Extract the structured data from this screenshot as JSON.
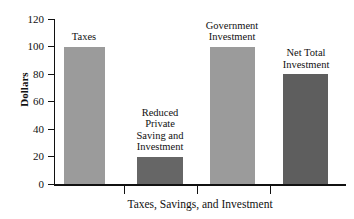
{
  "chart_data": {
    "type": "bar",
    "title": "",
    "xlabel": "Taxes, Savings, and Investment",
    "ylabel": "Dollars",
    "ylim": [
      0,
      120
    ],
    "yticks": [
      0,
      20,
      40,
      60,
      80,
      100,
      120
    ],
    "ytick_labels": [
      "0",
      "20",
      "40",
      "60",
      "80",
      "100",
      "120"
    ],
    "grid": false,
    "legend": null,
    "categories": [
      "Taxes",
      "Reduced\nPrivate\nSaving and\nInvestment",
      "Government\nInvestment",
      "Net Total\nInvestment"
    ],
    "values": [
      100,
      20,
      100,
      80
    ],
    "bar_colors": [
      "#9b9b9b",
      "#666666",
      "#9b9b9b",
      "#5e5e5e"
    ],
    "annotations": [
      {
        "text": "Taxes",
        "value": 100
      },
      {
        "text": "Reduced Private Saving and Investment",
        "value": 20
      },
      {
        "text": "Government Investment",
        "value": 100
      },
      {
        "text": "Net Total Investment",
        "value": 80
      }
    ]
  },
  "axes": {
    "y_title": "Dollars",
    "x_title": "Taxes, Savings, and Investment",
    "y_labels": {
      "t0": "0",
      "t20": "20",
      "t40": "40",
      "t60": "60",
      "t80": "80",
      "t100": "100",
      "t120": "120"
    }
  },
  "bars": [
    {
      "label": "Taxes",
      "value": 100,
      "color": "#9b9b9b"
    },
    {
      "label": "Reduced\nPrivate\nSaving and\nInvestment",
      "value": 20,
      "color": "#666666"
    },
    {
      "label": "Government\nInvestment",
      "value": 100,
      "color": "#9b9b9b"
    },
    {
      "label": "Net Total\nInvestment",
      "value": 80,
      "color": "#5e5e5e"
    }
  ]
}
